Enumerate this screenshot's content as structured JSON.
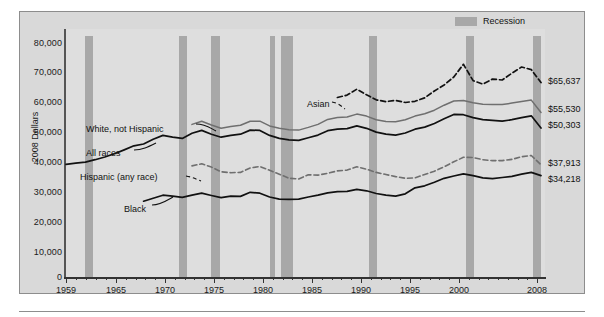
{
  "legend": {
    "label": "Recession",
    "swatch_color": "#a8a8a8"
  },
  "axes": {
    "ylabel": "2008 Dollars",
    "yticks": [
      "0",
      "10,000",
      "20,000",
      "30,000",
      "40,000",
      "50,000",
      "60,000",
      "70,000",
      "80,000"
    ],
    "xticks": [
      "1959",
      "1965",
      "1970",
      "1975",
      "1980",
      "1985",
      "1990",
      "1995",
      "2000",
      "2008"
    ]
  },
  "series_labels": {
    "white": "White, not Hispanic",
    "all": "All races",
    "hispanic": "Hispanic (any race)",
    "black": "Black",
    "asian": "Asian"
  },
  "end_values": {
    "asian": "$65,637",
    "white": "$55,530",
    "all": "$50,303",
    "hispanic": "$37,913",
    "black": "$34,218"
  },
  "chart_data": {
    "type": "line",
    "title": "",
    "subtitle": "",
    "xlabel": "",
    "ylabel": "2008 Dollars",
    "xlim": [
      1959,
      2008
    ],
    "ylim": [
      0,
      80000
    ],
    "grid": false,
    "legend_position": "top-right",
    "xtick_labels": [
      "1959",
      "1965",
      "1970",
      "1975",
      "1980",
      "1985",
      "1990",
      "1995",
      "2000",
      "2008"
    ],
    "ytick_labels": [
      "0",
      "10,000",
      "20,000",
      "30,000",
      "40,000",
      "50,000",
      "60,000",
      "70,000",
      "80,000"
    ],
    "annotations": [
      {
        "text": "White, not Hispanic",
        "kind": "series-callout"
      },
      {
        "text": "All races",
        "kind": "series-callout"
      },
      {
        "text": "Hispanic (any race)",
        "kind": "series-callout"
      },
      {
        "text": "Black",
        "kind": "series-callout"
      },
      {
        "text": "Asian",
        "kind": "series-callout"
      },
      {
        "text": "$65,637",
        "kind": "end-value"
      },
      {
        "text": "$55,530",
        "kind": "end-value"
      },
      {
        "text": "$50,303",
        "kind": "end-value"
      },
      {
        "text": "$37,913",
        "kind": "end-value"
      },
      {
        "text": "$34,218",
        "kind": "end-value"
      }
    ],
    "recessions": [
      {
        "start": 1960,
        "end": 1961
      },
      {
        "start": 1969,
        "end": 1970
      },
      {
        "start": 1973,
        "end": 1975
      },
      {
        "start": 1980,
        "end": 1980
      },
      {
        "start": 1981,
        "end": 1982
      },
      {
        "start": 1990,
        "end": 1991
      },
      {
        "start": 2001,
        "end": 2001
      },
      {
        "start": 2007,
        "end": 2008
      }
    ],
    "series": [
      {
        "name": "All races",
        "style": "solid-black",
        "x": [
          1959,
          1960,
          1961,
          1962,
          1963,
          1964,
          1965,
          1966,
          1967,
          1968,
          1969,
          1970,
          1971,
          1972,
          1973,
          1974,
          1975,
          1976,
          1977,
          1978,
          1979,
          1980,
          1981,
          1982,
          1983,
          1984,
          1985,
          1986,
          1987,
          1988,
          1989,
          1990,
          1991,
          1992,
          1993,
          1994,
          1995,
          1996,
          1997,
          1998,
          1999,
          2000,
          2001,
          2002,
          2003,
          2004,
          2005,
          2006,
          2007,
          2008
        ],
        "values": [
          38000,
          38400,
          38800,
          39600,
          40500,
          41600,
          42900,
          44300,
          44900,
          46500,
          47800,
          47200,
          46800,
          48500,
          49500,
          48200,
          47200,
          47800,
          48200,
          49600,
          49500,
          47800,
          46800,
          46300,
          46100,
          47000,
          47900,
          49400,
          49900,
          50100,
          51000,
          50200,
          48900,
          48200,
          47900,
          48600,
          49900,
          50600,
          51800,
          53400,
          54900,
          54800,
          53800,
          53100,
          52900,
          52600,
          53100,
          53800,
          54400,
          50303
        ]
      },
      {
        "name": "White, not Hispanic",
        "style": "solid-gray",
        "x": [
          1972,
          1973,
          1974,
          1975,
          1976,
          1977,
          1978,
          1979,
          1980,
          1981,
          1982,
          1983,
          1984,
          1985,
          1986,
          1987,
          1988,
          1989,
          1990,
          1991,
          1992,
          1993,
          1994,
          1995,
          1996,
          1997,
          1998,
          1999,
          2000,
          2001,
          2002,
          2003,
          2004,
          2005,
          2006,
          2007,
          2008
        ],
        "values": [
          51500,
          52600,
          51300,
          50200,
          50800,
          51200,
          52600,
          52600,
          51000,
          50200,
          49700,
          49600,
          50500,
          51500,
          53200,
          53800,
          54000,
          55000,
          54300,
          53100,
          52500,
          52400,
          53100,
          54300,
          55100,
          56300,
          58000,
          59400,
          59600,
          58800,
          58300,
          58200,
          58200,
          58700,
          59200,
          59700,
          55530
        ]
      },
      {
        "name": "Asian",
        "style": "dashed-black",
        "x": [
          1987,
          1988,
          1989,
          1990,
          1991,
          1992,
          1993,
          1994,
          1995,
          1996,
          1997,
          1998,
          1999,
          2000,
          2001,
          2002,
          2003,
          2004,
          2005,
          2006,
          2007,
          2008
        ],
        "values": [
          60600,
          61400,
          63400,
          61500,
          59800,
          59200,
          59600,
          58900,
          59300,
          60500,
          62800,
          64800,
          67500,
          71800,
          66300,
          65100,
          66800,
          66500,
          68800,
          70900,
          70000,
          65637
        ]
      },
      {
        "name": "Hispanic (any race)",
        "style": "dashed-gray",
        "x": [
          1972,
          1973,
          1974,
          1975,
          1976,
          1977,
          1978,
          1979,
          1980,
          1981,
          1982,
          1983,
          1984,
          1985,
          1986,
          1987,
          1988,
          1989,
          1990,
          1991,
          1992,
          1993,
          1994,
          1995,
          1996,
          1997,
          1998,
          1999,
          2000,
          2001,
          2002,
          2003,
          2004,
          2005,
          2006,
          2007,
          2008
        ],
        "values": [
          37500,
          38200,
          37100,
          35500,
          35200,
          35300,
          36800,
          37300,
          36000,
          34700,
          33300,
          33100,
          34500,
          34400,
          35000,
          35800,
          36100,
          37200,
          36400,
          35300,
          34600,
          33900,
          33300,
          33500,
          34600,
          35700,
          37200,
          38900,
          40400,
          40300,
          39600,
          39300,
          39300,
          39700,
          40600,
          41000,
          37913
        ]
      },
      {
        "name": "Black",
        "style": "solid-black",
        "x": [
          1967,
          1968,
          1969,
          1970,
          1971,
          1972,
          1973,
          1974,
          1975,
          1976,
          1977,
          1978,
          1979,
          1980,
          1981,
          1982,
          1983,
          1984,
          1985,
          1986,
          1987,
          1988,
          1989,
          1990,
          1991,
          1992,
          1993,
          1994,
          1995,
          1996,
          1997,
          1998,
          1999,
          2000,
          2001,
          2002,
          2003,
          2004,
          2005,
          2006,
          2007,
          2008
        ],
        "values": [
          25600,
          26600,
          27600,
          27300,
          26900,
          27600,
          28300,
          27500,
          26800,
          27300,
          27200,
          28600,
          28300,
          27000,
          26300,
          26200,
          26300,
          27000,
          27600,
          28400,
          28800,
          28900,
          29600,
          29100,
          28200,
          27600,
          27300,
          28100,
          30100,
          30800,
          32000,
          33300,
          34100,
          34800,
          34200,
          33500,
          33200,
          33600,
          34000,
          34700,
          35300,
          34218
        ]
      }
    ]
  }
}
